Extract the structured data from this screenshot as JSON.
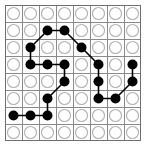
{
  "board": {
    "title": "8x8 dot grid path puzzle",
    "rows": 8,
    "cols": 8,
    "cell_size": 17,
    "origin_x": 5,
    "origin_y": 5,
    "circle_radius": 6.0,
    "filled_radius": 5.0,
    "colors": {
      "background": "#ffffff",
      "grid_line": "#8a8a8a",
      "border": "#6e6e6e",
      "empty_circle_stroke": "#b4b4b4",
      "empty_circle_fill": "#ffffff",
      "filled_node": "#000000",
      "edge_line": "#000000"
    },
    "grid_line_width": 1,
    "border_width": 1,
    "edge_line_width": 1.6
  },
  "cells": [
    {
      "row": 0,
      "col": 0,
      "state": "empty"
    },
    {
      "row": 0,
      "col": 1,
      "state": "empty"
    },
    {
      "row": 0,
      "col": 2,
      "state": "empty"
    },
    {
      "row": 0,
      "col": 3,
      "state": "empty"
    },
    {
      "row": 0,
      "col": 4,
      "state": "empty"
    },
    {
      "row": 0,
      "col": 5,
      "state": "empty"
    },
    {
      "row": 0,
      "col": 6,
      "state": "empty"
    },
    {
      "row": 0,
      "col": 7,
      "state": "empty"
    },
    {
      "row": 1,
      "col": 0,
      "state": "empty"
    },
    {
      "row": 1,
      "col": 1,
      "state": "empty"
    },
    {
      "row": 1,
      "col": 2,
      "state": "filled"
    },
    {
      "row": 1,
      "col": 3,
      "state": "filled"
    },
    {
      "row": 1,
      "col": 4,
      "state": "empty"
    },
    {
      "row": 1,
      "col": 5,
      "state": "empty"
    },
    {
      "row": 1,
      "col": 6,
      "state": "empty"
    },
    {
      "row": 1,
      "col": 7,
      "state": "empty"
    },
    {
      "row": 2,
      "col": 0,
      "state": "empty"
    },
    {
      "row": 2,
      "col": 1,
      "state": "filled"
    },
    {
      "row": 2,
      "col": 2,
      "state": "empty"
    },
    {
      "row": 2,
      "col": 3,
      "state": "empty"
    },
    {
      "row": 2,
      "col": 4,
      "state": "filled"
    },
    {
      "row": 2,
      "col": 5,
      "state": "empty"
    },
    {
      "row": 2,
      "col": 6,
      "state": "empty"
    },
    {
      "row": 2,
      "col": 7,
      "state": "empty"
    },
    {
      "row": 3,
      "col": 0,
      "state": "empty"
    },
    {
      "row": 3,
      "col": 1,
      "state": "filled"
    },
    {
      "row": 3,
      "col": 2,
      "state": "filled"
    },
    {
      "row": 3,
      "col": 3,
      "state": "filled"
    },
    {
      "row": 3,
      "col": 4,
      "state": "empty"
    },
    {
      "row": 3,
      "col": 5,
      "state": "filled"
    },
    {
      "row": 3,
      "col": 6,
      "state": "empty"
    },
    {
      "row": 3,
      "col": 7,
      "state": "filled"
    },
    {
      "row": 4,
      "col": 0,
      "state": "empty"
    },
    {
      "row": 4,
      "col": 1,
      "state": "empty"
    },
    {
      "row": 4,
      "col": 2,
      "state": "empty"
    },
    {
      "row": 4,
      "col": 3,
      "state": "filled"
    },
    {
      "row": 4,
      "col": 4,
      "state": "empty"
    },
    {
      "row": 4,
      "col": 5,
      "state": "filled"
    },
    {
      "row": 4,
      "col": 6,
      "state": "empty"
    },
    {
      "row": 4,
      "col": 7,
      "state": "filled"
    },
    {
      "row": 5,
      "col": 0,
      "state": "empty"
    },
    {
      "row": 5,
      "col": 1,
      "state": "empty"
    },
    {
      "row": 5,
      "col": 2,
      "state": "filled"
    },
    {
      "row": 5,
      "col": 3,
      "state": "empty"
    },
    {
      "row": 5,
      "col": 4,
      "state": "empty"
    },
    {
      "row": 5,
      "col": 5,
      "state": "filled"
    },
    {
      "row": 5,
      "col": 6,
      "state": "filled"
    },
    {
      "row": 5,
      "col": 7,
      "state": "empty"
    },
    {
      "row": 6,
      "col": 0,
      "state": "filled"
    },
    {
      "row": 6,
      "col": 1,
      "state": "filled"
    },
    {
      "row": 6,
      "col": 2,
      "state": "filled"
    },
    {
      "row": 6,
      "col": 3,
      "state": "empty"
    },
    {
      "row": 6,
      "col": 4,
      "state": "empty"
    },
    {
      "row": 6,
      "col": 5,
      "state": "empty"
    },
    {
      "row": 6,
      "col": 6,
      "state": "empty"
    },
    {
      "row": 6,
      "col": 7,
      "state": "empty"
    },
    {
      "row": 7,
      "col": 0,
      "state": "empty"
    },
    {
      "row": 7,
      "col": 1,
      "state": "empty"
    },
    {
      "row": 7,
      "col": 2,
      "state": "empty"
    },
    {
      "row": 7,
      "col": 3,
      "state": "empty"
    },
    {
      "row": 7,
      "col": 4,
      "state": "empty"
    },
    {
      "row": 7,
      "col": 5,
      "state": "empty"
    },
    {
      "row": 7,
      "col": 6,
      "state": "empty"
    },
    {
      "row": 7,
      "col": 7,
      "state": "empty"
    }
  ],
  "edges": [
    {
      "from": [
        1,
        2
      ],
      "to": [
        1,
        3
      ]
    },
    {
      "from": [
        1,
        2
      ],
      "to": [
        2,
        1
      ]
    },
    {
      "from": [
        1,
        3
      ],
      "to": [
        2,
        4
      ]
    },
    {
      "from": [
        2,
        1
      ],
      "to": [
        3,
        1
      ]
    },
    {
      "from": [
        2,
        4
      ],
      "to": [
        3,
        5
      ]
    },
    {
      "from": [
        3,
        1
      ],
      "to": [
        3,
        2
      ]
    },
    {
      "from": [
        3,
        2
      ],
      "to": [
        3,
        3
      ]
    },
    {
      "from": [
        3,
        3
      ],
      "to": [
        4,
        3
      ]
    },
    {
      "from": [
        3,
        5
      ],
      "to": [
        4,
        5
      ]
    },
    {
      "from": [
        3,
        7
      ],
      "to": [
        4,
        7
      ]
    },
    {
      "from": [
        4,
        3
      ],
      "to": [
        5,
        2
      ]
    },
    {
      "from": [
        4,
        5
      ],
      "to": [
        5,
        5
      ]
    },
    {
      "from": [
        5,
        5
      ],
      "to": [
        5,
        6
      ]
    },
    {
      "from": [
        5,
        6
      ],
      "to": [
        4,
        7
      ]
    },
    {
      "from": [
        5,
        2
      ],
      "to": [
        6,
        2
      ]
    },
    {
      "from": [
        6,
        2
      ],
      "to": [
        6,
        1
      ]
    },
    {
      "from": [
        6,
        1
      ],
      "to": [
        6,
        0
      ]
    }
  ]
}
